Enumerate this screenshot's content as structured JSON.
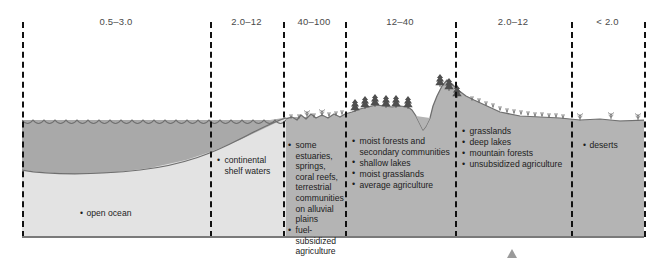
{
  "diagram": {
    "marker_x": 512,
    "panels": [
      {
        "id": "open-ocean",
        "label": "0.5–3.0",
        "x": 22,
        "w": 188,
        "fill": "#e9e9e9"
      },
      {
        "id": "continental-shelf",
        "label": "2.0–12",
        "x": 210,
        "w": 73,
        "fill": "#b6b6b6"
      },
      {
        "id": "estuaries",
        "label": "40–100",
        "x": 283,
        "w": 62,
        "fill": "#efefef"
      },
      {
        "id": "moist-forests",
        "label": "12–40",
        "x": 345,
        "w": 110,
        "fill": "#a8a8a8"
      },
      {
        "id": "grasslands",
        "label": "2.0–12",
        "x": 455,
        "w": 116,
        "fill": "#c9c9c9"
      },
      {
        "id": "deserts",
        "label": "< 2.0",
        "x": 571,
        "w": 73,
        "fill": "#dcdcdc"
      }
    ],
    "dividers": [
      22,
      210,
      283,
      345,
      455,
      571,
      644
    ],
    "labels": {
      "open_ocean": "open ocean",
      "continental_shelf_line1": "continental",
      "continental_shelf_line2": "shelf waters",
      "deserts": "deserts"
    },
    "lists": {
      "estuaries": [
        "some estuaries, springs, coral reefs, terrestrial communities on alluvial plains",
        "fuel-subsidized agriculture"
      ],
      "moist_forests": [
        "moist forests and secondary communities",
        "shallow lakes",
        "moist grasslands",
        "average agriculture"
      ],
      "grasslands": [
        "grasslands",
        "deep lakes",
        "mountain forests",
        "unsubsidized agriculture"
      ]
    },
    "colors": {
      "water_upper": "#a9a9a9",
      "water_lower": "#e2e2e2",
      "land_fill": "#b3b3b3",
      "outline": "#6f6f6f",
      "divider": "#111111",
      "marker": "#9a9a9a"
    }
  }
}
